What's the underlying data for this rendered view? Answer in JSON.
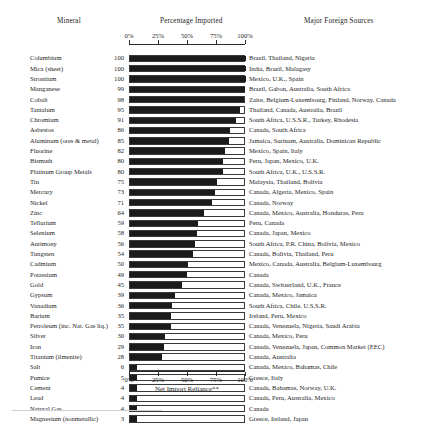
{
  "headers": {
    "mineral": "Mineral",
    "percentage": "Percentage Imported",
    "sources": "Major Foreign Sources"
  },
  "axis": {
    "caption": "Net Import Reliance**",
    "ticks": [
      "0%",
      "25%",
      "50%",
      "75%",
      "100%"
    ],
    "tick_values": [
      0,
      25,
      50,
      75,
      100
    ]
  },
  "chart_data": {
    "type": "bar",
    "orientation": "horizontal",
    "title": "Percentage Imported",
    "xlabel": "Net Import Reliance**",
    "ylabel": "Mineral",
    "xlim": [
      0,
      100
    ],
    "grid": false,
    "legend": "none",
    "tick_labels": [
      "0%",
      "25%",
      "50%",
      "75%",
      "100%"
    ],
    "categories": [
      "Columbium",
      "Mica (sheet)",
      "Strontium",
      "Manganese",
      "Cobalt",
      "Tantalum",
      "Chromium",
      "Asbestos",
      "Aluminum (ores & metal)",
      "Fluorine",
      "Bismuth",
      "Platinum Group Metals",
      "Tin",
      "Mercury",
      "Nickel",
      "Zinc",
      "Tellurium",
      "Selenium",
      "Antimony",
      "Tungsten",
      "Cadmium",
      "Potassium",
      "Gold",
      "Gypsum",
      "Vanadium",
      "Barium",
      "Petroleum (inc. Nat. Gas liq.)",
      "Silver",
      "Iron",
      "Titanium (ilmenite)",
      "Salt",
      "Pumice",
      "Cement",
      "Lead",
      "Natural Gas",
      "Magnesium (nonmetallic)"
    ],
    "values": [
      100,
      100,
      100,
      99,
      98,
      95,
      91,
      86,
      85,
      82,
      80,
      80,
      75,
      73,
      71,
      64,
      59,
      58,
      56,
      54,
      50,
      49,
      45,
      39,
      36,
      35,
      35,
      30,
      29,
      28,
      6,
      5,
      4,
      4,
      4,
      3
    ],
    "sources": [
      "Brazil, Thailand, Nigeria",
      "India, Brazil, Malagasy",
      "Mexico, U.K., Spain",
      "Brazil, Gabon, Australia, South Africa",
      "Zaire, Belgium-Luxembourg, Finland, Norway, Canada",
      "Thailand, Canada, Australia, Brazil",
      "South Africa, U.S.S.R., Turkey, Rhodesia",
      "Canada, South Africa",
      "Jamaica, Surinam, Australia, Dominican Republic",
      "Mexico, Spain, Italy",
      "Peru, Japan, Mexico, U.K.",
      "South Africa, U.K., U.S.S.R.",
      "Malaysia, Thailand, Bolivia",
      "Canada, Algeria, Mexico, Spain",
      "Canada, Norway",
      "Canada, Mexico, Australia, Honduras, Peru",
      "Peru, Canada",
      "Canada, Japan, Mexico",
      "South Africa, P.R. China, Bolivia, Mexico",
      "Canada, Bolivia, Thailand, Peru",
      "Mexico, Canada, Australia, Belgium-Luxembourg",
      "Canada",
      "Canada, Switzerland, U.K., France",
      "Canada, Mexico, Jamaica",
      "South Africa, Chile, U.S.S.R.",
      "Ireland, Peru, Mexico",
      "Canada, Venezuela, Nigeria, Saudi Arabia",
      "Canada, Mexico, Peru",
      "Canada, Venezuela, Japan, Common Market (EEC)",
      "Canada, Australia",
      "Canada, Mexico, Bahamas, Chile",
      "Greece, Italy",
      "Canada, Bahamas, Norway, U.K.",
      "Canada, Peru, Australia, Mexico",
      "Canada",
      "Greece, Ireland, Japan"
    ]
  }
}
